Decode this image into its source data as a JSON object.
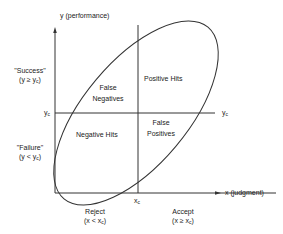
{
  "diagram": {
    "y_axis_label": "y (performance)",
    "x_axis_label": "x (judgment)",
    "success_label": "\"Success\"",
    "success_cond": "(y ≥ y",
    "failure_label": "\"Failure\"",
    "failure_cond": "(y < y",
    "yc_label_left": "y",
    "yc_label_right": "y",
    "xc_label": "x",
    "sub_c": "c",
    "reject_label": "Reject",
    "reject_cond": "(x < x",
    "accept_label": "Accept",
    "accept_cond": "(x ≥ x",
    "close_paren": ")",
    "quadrants": {
      "false_negatives_1": "False",
      "false_negatives_2": "Negatives",
      "positive_hits": "Positive Hits",
      "negative_hits": "Negative Hits",
      "false_positives_1": "False",
      "false_positives_2": "Positives"
    }
  }
}
